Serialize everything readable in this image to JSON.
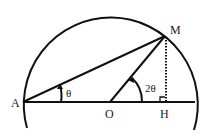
{
  "diagram": {
    "points": {
      "A": {
        "label": "A",
        "x": 23,
        "y": 102
      },
      "O": {
        "label": "O",
        "x": 110,
        "y": 102
      },
      "M": {
        "label": "M",
        "x": 165,
        "y": 36
      },
      "H": {
        "label": "H",
        "x": 165,
        "y": 102
      }
    },
    "angles": {
      "at_A": "θ",
      "at_O": "2θ"
    },
    "colors": {
      "stroke": "#111111",
      "background": "#ffffff"
    }
  }
}
